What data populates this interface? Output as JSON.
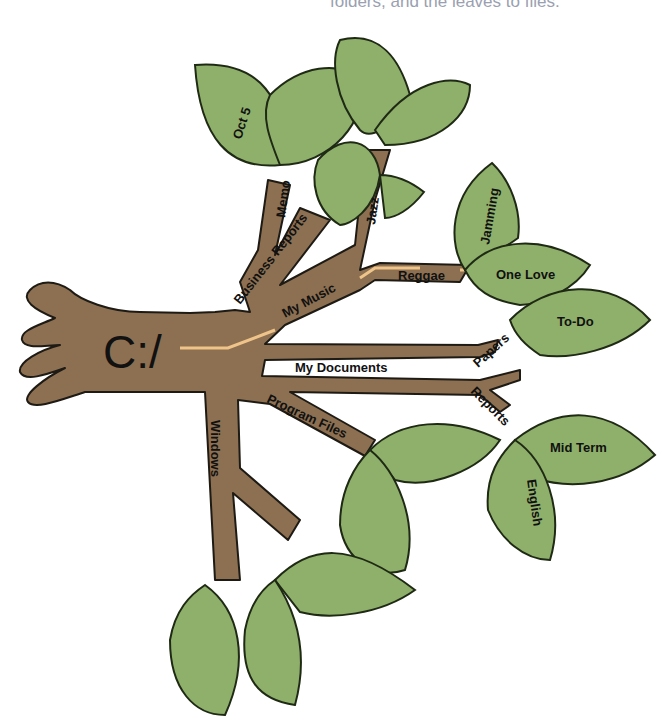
{
  "caption": "folders, and the leaves to files.",
  "colors": {
    "branch": "#8c7051",
    "leaf": "#8fb06b",
    "path_highlight": "#efc48a",
    "caption": "#9aa0b0"
  },
  "tree": {
    "root": "C:/",
    "folders": {
      "business_reports": "Business Reports",
      "memo": "Memo",
      "my_music": "My Music",
      "jazz": "Jazz",
      "reggae": "Reggae",
      "my_documents": "My Documents",
      "papers": "Papers",
      "reports": "Reports",
      "program_files": "Program Files",
      "windows": "Windows"
    },
    "files": {
      "oct5": "Oct 5",
      "jamming": "Jamming",
      "one_love": "One Love",
      "todo": "To-Do",
      "mid_term": "Mid Term",
      "english": "English"
    }
  }
}
